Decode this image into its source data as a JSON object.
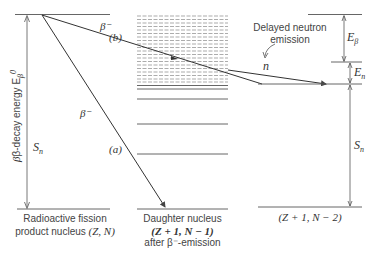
{
  "diagram": {
    "left_axis_label": "β-decay energy E",
    "left_axis_sup": "0",
    "left_axis_sub": "β",
    "sn_left": "S",
    "sn_left_sub": "n",
    "beta_a": "β⁻",
    "label_a": "(a)",
    "beta_b": "β⁻",
    "label_b": "(b)",
    "delayed_label_1": "Delayed neutron",
    "delayed_label_2": "emission",
    "n_label": "n",
    "e_beta": "E",
    "e_beta_sub": "β",
    "e_n": "E",
    "e_n_sub": "n",
    "sn_right": "S",
    "sn_right_sub": "n",
    "nucleus_left_1": "Radioactive fission",
    "nucleus_left_2": "product nucleus",
    "nucleus_left_3": "(Z, N)",
    "nucleus_mid_1": "Daughter nucleus",
    "nucleus_mid_2": "(Z + 1, N − 1)",
    "nucleus_mid_3": "after β⁻-emission",
    "nucleus_right": "(Z + 1, N − 2)",
    "line_color": "#444444"
  }
}
